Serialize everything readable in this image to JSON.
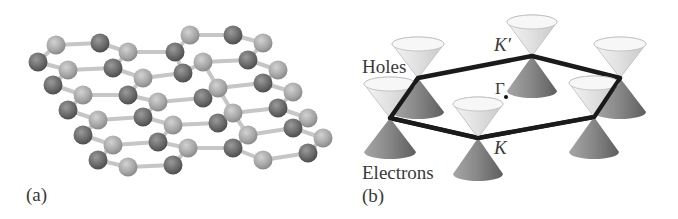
{
  "panels": {
    "a": {
      "label": "(a)",
      "description": "Graphene honeycomb lattice, ball-and-stick model",
      "colors": {
        "atom_light": "#a8a8a8",
        "atom_dark": "#6e6e6e",
        "bond": "#c8c8c8"
      }
    },
    "b": {
      "label": "(b)",
      "description": "Dirac cones at Brillouin zone corners",
      "labels": {
        "holes": "Holes",
        "electrons": "Electrons",
        "k_prime": "K′",
        "k": "K",
        "gamma": "Γ"
      },
      "colors": {
        "hexagon": "#1a1a1a",
        "cone_upper": "#e4e4e4",
        "cone_lower": "#8a8a8a"
      }
    }
  }
}
